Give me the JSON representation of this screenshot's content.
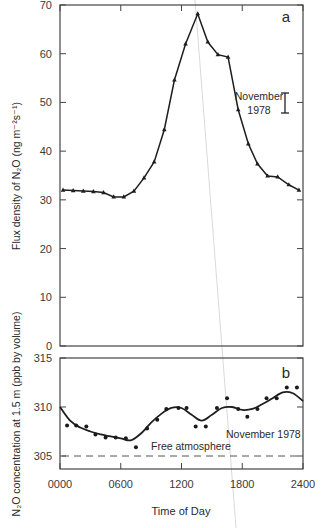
{
  "chart_data": [
    {
      "type": "line",
      "panel": "a",
      "title": "",
      "xlabel": "Time of Day",
      "ylabel": "Flux density of N2O (ng m^-2 s^-1)",
      "xlim": [
        0,
        24
      ],
      "ylim": [
        0,
        70
      ],
      "yticks": [
        0,
        10,
        20,
        30,
        40,
        50,
        60,
        70
      ],
      "xticks": [
        "0000",
        "0600",
        "1200",
        "1800",
        "2400"
      ],
      "grid": false,
      "series": [
        {
          "name": "N2O flux",
          "marker": "triangle",
          "x": [
            0.3,
            1.3,
            2.3,
            3.3,
            4.3,
            5.3,
            6.3,
            7.3,
            8.3,
            9.3,
            10.3,
            11.3,
            12.4,
            13.6,
            14.6,
            15.6,
            16.6,
            17.6,
            18.6,
            19.5,
            20.5,
            21.5,
            22.6,
            23.6
          ],
          "values": [
            32.0,
            31.9,
            31.8,
            31.7,
            31.5,
            30.6,
            30.6,
            31.8,
            34.5,
            37.8,
            44.4,
            54.6,
            62.0,
            68.2,
            62.4,
            59.8,
            59.3,
            48.5,
            41.5,
            37.4,
            34.9,
            34.7,
            33.1,
            32.0
          ]
        }
      ],
      "annotations": [
        {
          "text": "a",
          "position": "top-right"
        },
        {
          "text": "November 1978",
          "type": "error-bar",
          "y_range": [
            48,
            52
          ]
        }
      ]
    },
    {
      "type": "scatter",
      "panel": "b",
      "title": "",
      "xlabel": "Time of Day",
      "ylabel": "N2O concentration at 1.5 m (ppb by volume)",
      "xlim": [
        0,
        24
      ],
      "ylim": [
        303.7,
        315
      ],
      "yticks": [
        305,
        310,
        315
      ],
      "xticks": [
        "0000",
        "0600",
        "1200",
        "1800",
        "2400"
      ],
      "grid": false,
      "series": [
        {
          "name": "N2O concentration (observed)",
          "marker": "dot",
          "x": [
            0.7,
            1.6,
            2.6,
            3.5,
            4.5,
            5.5,
            6.5,
            7.5,
            8.6,
            9.6,
            10.5,
            11.7,
            12.5,
            13.4,
            14.4,
            15.5,
            16.5,
            17.6,
            18.5,
            19.5,
            20.4,
            21.4,
            22.4,
            23.4
          ],
          "values": [
            308.1,
            308.1,
            308.0,
            307.2,
            306.9,
            306.9,
            306.8,
            305.9,
            307.8,
            308.7,
            309.8,
            309.9,
            309.9,
            308.0,
            308.0,
            309.9,
            310.9,
            309.8,
            309.0,
            309.8,
            310.9,
            310.9,
            312.0,
            312.0
          ]
        },
        {
          "name": "Smoothed fit",
          "style": "solid-line",
          "x": [
            0,
            1,
            2,
            3,
            4,
            5,
            6,
            7,
            8,
            9,
            10,
            11,
            12,
            13,
            14,
            15,
            16,
            17,
            18,
            19,
            20,
            21,
            22,
            23,
            24
          ],
          "values": [
            310.0,
            308.6,
            307.9,
            307.5,
            307.2,
            307.0,
            306.8,
            306.6,
            307.3,
            308.4,
            309.3,
            309.9,
            309.9,
            309.2,
            308.6,
            309.2,
            309.9,
            310.0,
            309.7,
            309.8,
            310.3,
            310.9,
            311.5,
            311.4,
            310.6
          ]
        },
        {
          "name": "Free atmosphere",
          "style": "dashed-line",
          "x": [
            0,
            24
          ],
          "values": [
            305,
            305
          ]
        }
      ],
      "annotations": [
        {
          "text": "b",
          "position": "top-right"
        },
        {
          "text": "November 1978"
        },
        {
          "text": "Free atmosphere"
        }
      ]
    }
  ],
  "labels": {
    "panel_a_letter": "a",
    "panel_b_letter": "b",
    "error_bar_line1": "November",
    "error_bar_line2": "1978",
    "panel_b_note": "November  1978",
    "free_atmosphere": "Free atmosphere",
    "x_title": "Time of Day",
    "y_title_a": "Flux density of N₂O (ng m⁻²s⁻¹)",
    "y_title_b": "N₂O concentration at 1.5 m (ppb by volume)",
    "a_ticks": [
      "0",
      "10",
      "20",
      "30",
      "40",
      "50",
      "60",
      "70"
    ],
    "b_ticks": [
      "305",
      "310",
      "315"
    ],
    "x_ticks": [
      "0000",
      "0600",
      "1200",
      "1800",
      "2400"
    ]
  },
  "colors": {
    "ink": "#2a2a2a",
    "axis": "#444444",
    "scan_line": "#c8c8c8",
    "background": "#ffffff"
  }
}
